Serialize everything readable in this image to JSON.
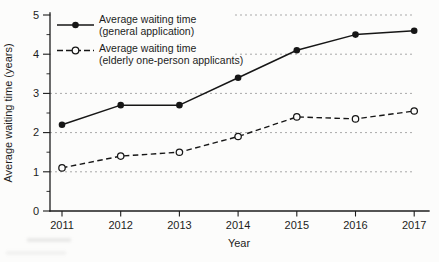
{
  "chart_data": {
    "type": "line",
    "title": "",
    "xlabel": "Year",
    "ylabel": "Average waiting time (years)",
    "x": [
      "2011",
      "2012",
      "2013",
      "2014",
      "2015",
      "2016",
      "2017"
    ],
    "ylim": [
      0,
      5
    ],
    "yticks": [
      0,
      1,
      2,
      3,
      4,
      5
    ],
    "y_minor_tick_step": 0.5,
    "grid": {
      "horizontal_at": [
        1,
        2,
        3,
        4,
        5
      ],
      "style": "dotted-dashed"
    },
    "legend_position": "top-left-inside",
    "series": [
      {
        "name": "Average waiting time (general application)",
        "legend_lines": [
          "Average waiting time",
          "(general application)"
        ],
        "line_style": "solid",
        "marker": "filled-circle",
        "color": "#161616",
        "values": [
          2.2,
          2.7,
          2.7,
          3.4,
          4.1,
          4.5,
          4.6
        ]
      },
      {
        "name": "Average waiting time (elderly one-person applicants)",
        "legend_lines": [
          "Average waiting time",
          "(elderly one-person applicants)"
        ],
        "line_style": "dashed",
        "marker": "open-circle",
        "color": "#161616",
        "values": [
          1.1,
          1.4,
          1.5,
          1.9,
          2.4,
          2.35,
          2.55
        ]
      }
    ]
  },
  "colors": {
    "background": "#fcfcfb",
    "axis": "#1c1c1c",
    "grid": "#a9a9a9",
    "text": "#1c1c1c"
  }
}
